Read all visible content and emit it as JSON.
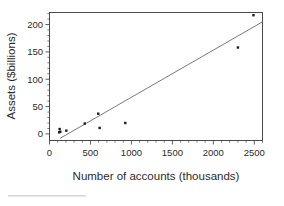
{
  "chart_data": {
    "type": "scatter",
    "title": "",
    "xlabel": "Number of accounts (thousands)",
    "ylabel": "Assets ($billions)",
    "xlim": [
      0,
      2600
    ],
    "ylim": [
      -12,
      222
    ],
    "grid": false,
    "legend": null,
    "xticks": [
      0,
      500,
      1000,
      1500,
      2000,
      2500
    ],
    "xtick_labels": [
      "0",
      "500",
      "1000",
      "1500",
      "2000",
      "2500"
    ],
    "xminor_step": 100,
    "yticks": [
      0,
      50,
      100,
      150,
      200
    ],
    "ytick_labels": [
      "0",
      "50",
      "100",
      "150",
      "200"
    ],
    "yminor_step": 10,
    "points": [
      {
        "x": 118,
        "y": 3
      },
      {
        "x": 124,
        "y": 9
      },
      {
        "x": 132,
        "y": 4
      },
      {
        "x": 205,
        "y": 6
      },
      {
        "x": 430,
        "y": 19
      },
      {
        "x": 595,
        "y": 37
      },
      {
        "x": 612,
        "y": 11
      },
      {
        "x": 925,
        "y": 20
      },
      {
        "x": 2300,
        "y": 158
      },
      {
        "x": 2490,
        "y": 217
      }
    ],
    "marker": "square",
    "marker_color": "#1a1a1a",
    "fit_line": {
      "type": "linear-regression",
      "x_start": 130,
      "y_start": -8,
      "x_end": 2600,
      "y_end": 205,
      "color": "#6b6b6b"
    }
  },
  "ticks": {
    "x": [
      "0",
      "500",
      "1000",
      "1500",
      "2000",
      "2500"
    ],
    "y": [
      "0",
      "50",
      "100",
      "150",
      "200"
    ]
  },
  "labels": {
    "x_axis": "Number of accounts (thousands)",
    "y_axis": "Assets ($billions)"
  }
}
